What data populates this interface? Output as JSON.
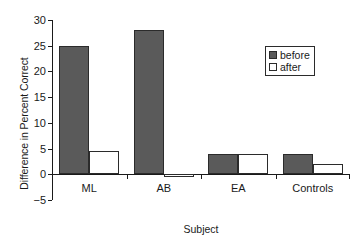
{
  "chart_data": {
    "type": "bar",
    "title": "",
    "xlabel": "Subject",
    "ylabel": "Difference in Percent Correct",
    "categories": [
      "ML",
      "AB",
      "EA",
      "Controls"
    ],
    "series": [
      {
        "name": "before",
        "color": "#5a5a5a",
        "values": [
          25,
          28,
          4,
          4
        ]
      },
      {
        "name": "after",
        "color": "#ffffff",
        "values": [
          4.5,
          -0.5,
          4,
          2
        ]
      }
    ],
    "ylim": [
      -5,
      30
    ],
    "yticks": [
      30,
      25,
      20,
      15,
      10,
      5,
      0,
      -5
    ],
    "ytick_labels": [
      "30",
      "25",
      "20",
      "15",
      "10",
      "5",
      "0",
      "−5"
    ],
    "grid": false,
    "legend_position": "upper-right",
    "legend_entries": [
      "before",
      "after"
    ]
  }
}
